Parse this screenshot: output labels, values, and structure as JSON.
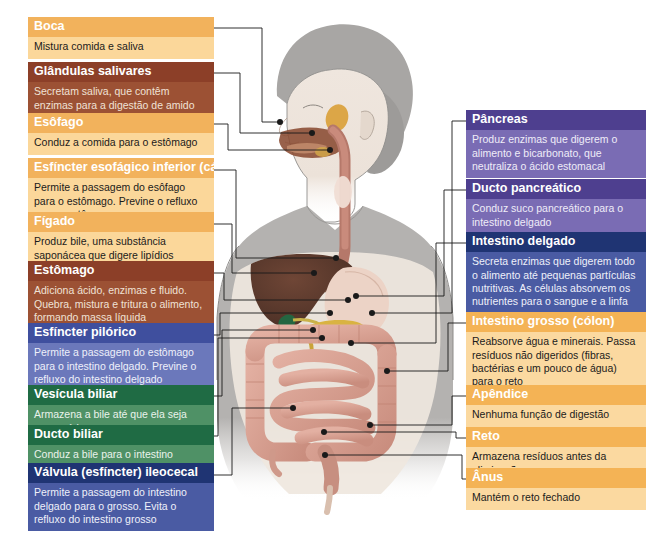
{
  "figure": {
    "alt": "Ilustração de corpo feminino com sistema digestório sobreposto",
    "organ_names": [
      "boca",
      "glandulas-salivares",
      "esofago",
      "cardia",
      "figado",
      "estomago",
      "piloro",
      "vesicula-biliar",
      "ducto-biliar",
      "valvula-ileocecal",
      "pancreas",
      "ducto-pancreatico",
      "intestino-delgado",
      "intestino-grosso",
      "apendice",
      "reto",
      "anus"
    ]
  },
  "left_labels": [
    {
      "id": "boca",
      "title": "Boca",
      "text": "Mistura comida e saliva",
      "variant": "v-orange",
      "x": 28,
      "y": 17,
      "w": 186,
      "line": [
        [
          214,
          28
        ],
        [
          262,
          28
        ],
        [
          262,
          122
        ],
        [
          280,
          122
        ]
      ]
    },
    {
      "id": "glandulas-salivares",
      "title": "Glândulas salivares",
      "text": "Secretam saliva, que contêm enzimas para a digestão de amido",
      "variant": "v-brown",
      "x": 28,
      "y": 62,
      "w": 186,
      "line": [
        [
          214,
          73
        ],
        [
          240,
          73
        ],
        [
          240,
          133
        ],
        [
          312,
          133
        ]
      ]
    },
    {
      "id": "esofago",
      "title": "Esôfago",
      "text": "Conduz a comida para o estômago",
      "variant": "v-orange",
      "x": 28,
      "y": 113,
      "w": 186,
      "line": [
        [
          214,
          124
        ],
        [
          228,
          124
        ],
        [
          228,
          150
        ],
        [
          330,
          150
        ]
      ]
    },
    {
      "id": "cardia",
      "title": "Esfíncter esofágico inferior (cárdia)",
      "text": "Permite a passagem do esôfago para o estômago. Previne o refluxo para o estômago",
      "variant": "v-orange",
      "x": 28,
      "y": 158,
      "w": 186,
      "line": [
        [
          214,
          170
        ],
        [
          236,
          170
        ],
        [
          236,
          258
        ],
        [
          336,
          258
        ]
      ]
    },
    {
      "id": "figado",
      "title": "Fígado",
      "text": "Produz bile, uma substância saponácea que digere lipídios",
      "variant": "v-orange",
      "x": 28,
      "y": 212,
      "w": 186,
      "line": [
        [
          214,
          224
        ],
        [
          232,
          224
        ],
        [
          232,
          273
        ],
        [
          314,
          273
        ]
      ]
    },
    {
      "id": "estomago",
      "title": "Estômago",
      "text": "Adiciona ácido, enzimas e fluido. Quebra, mistura e tritura o alimento, formando massa líquida",
      "variant": "v-brown",
      "x": 28,
      "y": 261,
      "w": 186,
      "line": [
        [
          214,
          273
        ],
        [
          224,
          273
        ],
        [
          224,
          300
        ],
        [
          348,
          300
        ]
      ]
    },
    {
      "id": "piloro",
      "title": "Esfíncter pilórico",
      "text": "Permite a passagem do estômago para o intestino delgado. Previne o refluxo do intestino delgado",
      "variant": "v-blue",
      "x": 28,
      "y": 323,
      "w": 186,
      "line": [
        [
          214,
          335
        ],
        [
          220,
          335
        ],
        [
          220,
          313
        ],
        [
          330,
          313
        ]
      ]
    },
    {
      "id": "vesicula-biliar",
      "title": "Vesícula biliar",
      "text": "Armazena a bile até que ela seja necessária",
      "variant": "v-green",
      "x": 28,
      "y": 385,
      "w": 186,
      "line": [
        [
          214,
          396
        ],
        [
          222,
          396
        ],
        [
          222,
          330
        ],
        [
          313,
          330
        ]
      ]
    },
    {
      "id": "ducto-biliar",
      "title": "Ducto biliar",
      "text": "Conduz a bile para o intestino delgado",
      "variant": "v-green",
      "x": 28,
      "y": 425,
      "w": 186,
      "line": [
        [
          214,
          436
        ],
        [
          218,
          436
        ],
        [
          218,
          338
        ],
        [
          322,
          338
        ]
      ]
    },
    {
      "id": "valvula-ileocecal",
      "title": "Válvula (esfíncter) ileocecal",
      "text": "Permite a passagem do intestino delgado para o grosso. Evita o refluxo do intestino grosso",
      "variant": "v-navy",
      "x": 28,
      "y": 463,
      "w": 186,
      "line": [
        [
          214,
          475
        ],
        [
          232,
          475
        ],
        [
          232,
          408
        ],
        [
          293,
          408
        ]
      ]
    }
  ],
  "right_labels": [
    {
      "id": "pancreas",
      "title": "Pâncreas",
      "text": "Produz enzimas que digerem o alimento e bicarbonato, que neutraliza o ácido estomacal",
      "variant": "v-purple",
      "x": 466,
      "y": 110,
      "w": 180,
      "line": [
        [
          466,
          121
        ],
        [
          452,
          121
        ],
        [
          452,
          313
        ],
        [
          372,
          313
        ]
      ]
    },
    {
      "id": "ducto-pancreatico",
      "title": "Ducto pancreático",
      "text": "Conduz suco pancreático para o intestino delgado",
      "variant": "v-purple",
      "x": 466,
      "y": 179,
      "w": 180,
      "line": [
        [
          466,
          190
        ],
        [
          444,
          190
        ],
        [
          444,
          296
        ],
        [
          356,
          296
        ]
      ]
    },
    {
      "id": "intestino-delgado",
      "title": "Intestino delgado",
      "text": "Secreta enzimas que digerem todo o alimento até pequenas partículas nutritivas. As células absorvem os nutrientes para o sangue e a linfa",
      "variant": "v-navy",
      "x": 466,
      "y": 232,
      "w": 180,
      "line": [
        [
          466,
          243
        ],
        [
          436,
          243
        ],
        [
          436,
          343
        ],
        [
          351,
          343
        ]
      ]
    },
    {
      "id": "intestino-grosso",
      "title": "Intestino grosso (cólon)",
      "text": "Reabsorve água e minerais. Passa resíduos não digeridos (fibras, bactérias e um pouco de água) para o reto",
      "variant": "v-amber",
      "x": 466,
      "y": 312,
      "w": 180,
      "line": [
        [
          466,
          323
        ],
        [
          448,
          323
        ],
        [
          448,
          371
        ],
        [
          387,
          371
        ]
      ]
    },
    {
      "id": "apendice",
      "title": "Apêndice",
      "text": "Nenhuma função de digestão",
      "variant": "v-amber",
      "x": 466,
      "y": 385,
      "w": 180,
      "line": [
        [
          466,
          396
        ],
        [
          452,
          396
        ],
        [
          452,
          425
        ],
        [
          370,
          425
        ]
      ]
    },
    {
      "id": "reto",
      "title": "Reto",
      "text": "Armazena resíduos antes da eliminação",
      "variant": "v-amber",
      "x": 466,
      "y": 427,
      "w": 180,
      "line": [
        [
          466,
          438
        ],
        [
          456,
          438
        ],
        [
          456,
          432
        ],
        [
          324,
          432
        ]
      ]
    },
    {
      "id": "anus",
      "title": "Ânus",
      "text": "Mantém o reto fechado",
      "variant": "v-amber",
      "x": 466,
      "y": 468,
      "w": 180,
      "line": [
        [
          466,
          479
        ],
        [
          462,
          479
        ],
        [
          462,
          455
        ],
        [
          325,
          455
        ]
      ]
    }
  ],
  "colors": {
    "orange_head": "#f2b25c",
    "orange_body": "#fbd79a",
    "brown_head": "#8c3f28",
    "brown_body": "#9c5134",
    "purple_head": "#4e3f8f",
    "purple_body": "#7a6cb4",
    "blue_head": "#3f4f9e",
    "blue_body": "#6b78bb",
    "navy_head": "#1f3473",
    "navy_body": "#4a5ba3",
    "green_head": "#1f6b44",
    "green_body": "#4f9166",
    "leader_line": "#1a1a1a",
    "skin": "#b0aeac",
    "liver": "#5c3b2e",
    "stomach": "#e8cfc2",
    "intestine": "#d9a294",
    "pancreas": "#d8b43c"
  }
}
